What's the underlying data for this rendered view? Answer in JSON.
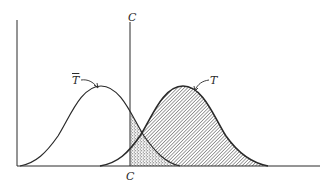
{
  "diagram": {
    "type": "overlapping-normal-distributions",
    "labels": {
      "criterion_top": "C",
      "criterion_bottom": "C",
      "curve_left": "T",
      "curve_left_bar": true,
      "curve_right": "T"
    },
    "colors": {
      "ink": "#2a2a2a",
      "background": "#ffffff",
      "hatch": "#555555",
      "stipple": "#444444"
    },
    "regions": [
      {
        "name": "right-curve-above-criterion",
        "fill": "diagonal-hatch"
      },
      {
        "name": "left-curve-tail-above-criterion",
        "fill": "stipple"
      }
    ]
  }
}
